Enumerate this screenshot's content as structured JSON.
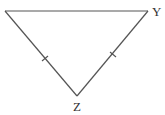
{
  "diagram": {
    "type": "isosceles-triangle",
    "vertices": [
      {
        "id": "left",
        "label": "",
        "x": 5,
        "y": 11
      },
      {
        "id": "Y",
        "label": "Y",
        "x": 148,
        "y": 11
      },
      {
        "id": "Z",
        "label": "Z",
        "x": 77,
        "y": 96
      }
    ],
    "edges": [
      {
        "from": "left",
        "to": "Y",
        "tick_marks": 0
      },
      {
        "from": "left",
        "to": "Z",
        "tick_marks": 1
      },
      {
        "from": "Y",
        "to": "Z",
        "tick_marks": 1
      }
    ],
    "labels": {
      "Y": "Y",
      "Z": "Z"
    },
    "colors": {
      "stroke": "#555555",
      "text": "#333333",
      "background": "#ffffff"
    }
  }
}
